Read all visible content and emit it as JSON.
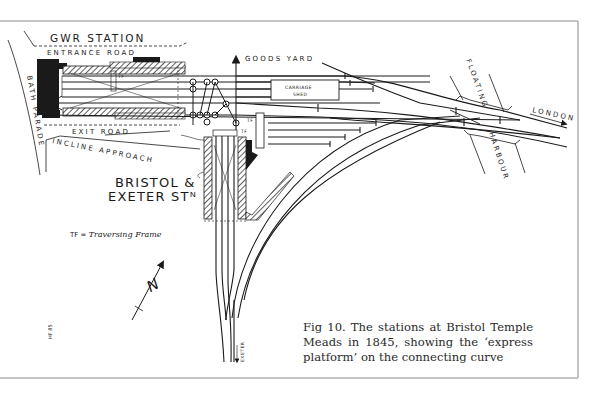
{
  "figure": {
    "number": "Fig 10.",
    "caption": "Fig 10. The stations at Bristol Temple Meads in 1845, showing the ‘express platform’ on the connecting curve"
  },
  "labels": {
    "gwr_station": "GWR STATION",
    "entrance_road": "ENTRANCE  ROAD",
    "exit_road": "EXIT  ROAD",
    "incline_approach": "INCLINE APPROACH",
    "bath_parade": "BATH PARADE",
    "goods_yard": "GOODS YARD",
    "carriage_shed_1": "CARRIAGE",
    "carriage_shed_2": "SHED",
    "bristol_exeter_1": "BRISTOL &",
    "bristol_exeter_2": "EXETER STᴺ",
    "floating": "FLOATING",
    "harbour": "HARBOUR",
    "london": "LONDON",
    "exeter": "EXETER",
    "tf_short": "TF",
    "north": "N",
    "artist_initials": "HF 85"
  },
  "legend": {
    "key": "TF",
    "equals": " = ",
    "meaning": "Traversing Frame"
  },
  "colors": {
    "ink": "#1a1a1a",
    "paper": "#ffffff",
    "frame": "#8a8a8a"
  }
}
